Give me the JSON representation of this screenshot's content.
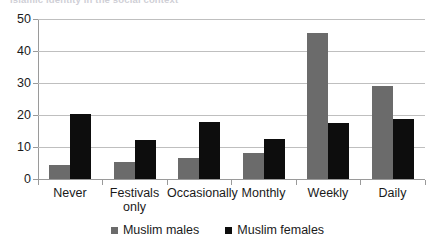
{
  "caption": {
    "text": "Islamic identity in the social context"
  },
  "legend": {
    "position": "bottom",
    "items": [
      {
        "label": "Muslim males",
        "color": "#6b6b6b",
        "marker": "square-swatch-icon"
      },
      {
        "label": "Muslim females",
        "color": "#0d0d0d",
        "marker": "square-swatch-icon"
      }
    ]
  },
  "axis": {
    "y_ticks": [
      "50",
      "40",
      "30",
      "20",
      "10",
      "0"
    ],
    "x_categories": [
      {
        "line1": "Never",
        "line2": ""
      },
      {
        "line1": "Festivals",
        "line2": "only"
      },
      {
        "line1": "Occasionally",
        "line2": ""
      },
      {
        "line1": "Monthly",
        "line2": ""
      },
      {
        "line1": "Weekly",
        "line2": ""
      },
      {
        "line1": "Daily",
        "line2": ""
      }
    ]
  },
  "chart_data": {
    "type": "bar",
    "title": "",
    "xlabel": "",
    "ylabel": "",
    "ylim": [
      0,
      50
    ],
    "yticks": [
      0,
      10,
      20,
      30,
      40,
      50
    ],
    "grid": true,
    "legend_position": "bottom",
    "categories": [
      "Never",
      "Festivals only",
      "Occasionally",
      "Monthly",
      "Weekly",
      "Daily"
    ],
    "series": [
      {
        "name": "Muslim males",
        "color": "#6b6b6b",
        "values": [
          4.5,
          5.2,
          6.5,
          8.0,
          45.6,
          29.0
        ]
      },
      {
        "name": "Muslim females",
        "color": "#0d0d0d",
        "values": [
          20.4,
          12.1,
          17.8,
          12.4,
          17.6,
          18.9
        ]
      }
    ]
  }
}
